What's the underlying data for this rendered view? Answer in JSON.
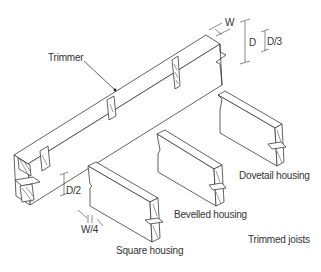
{
  "diagram": {
    "title": "Trimmed joists",
    "labels": {
      "trimmer": "Trimmer",
      "width": "W",
      "depth": "D",
      "depth_third": "D/3",
      "depth_half": "D/2",
      "width_quarter": "W/4",
      "square_housing": "Square housing",
      "bevelled_housing": "Bevelled housing",
      "dovetail_housing": "Dovetail housing",
      "caption": "Trimmed joists"
    },
    "components": [
      {
        "name": "trimmer",
        "type": "beam",
        "note": "long timber with housings cut along its side"
      },
      {
        "name": "square-housing-joist",
        "joint": "Square housing",
        "dimensions": [
          "D/2",
          "W/4"
        ]
      },
      {
        "name": "bevelled-housing-joist",
        "joint": "Bevelled housing"
      },
      {
        "name": "dovetail-housing-joist",
        "joint": "Dovetail housing"
      }
    ],
    "dimensions": [
      {
        "label": "W",
        "meaning": "width of trimmer"
      },
      {
        "label": "D",
        "meaning": "depth of trimmer"
      },
      {
        "label": "D/3",
        "meaning": "depth of tusk / housing offset"
      },
      {
        "label": "D/2",
        "meaning": "housing depth"
      },
      {
        "label": "W/4",
        "meaning": "housing cut into trimmer width"
      }
    ],
    "colors": {
      "line": "#3a3a3a",
      "text": "#333333",
      "background": "#ffffff"
    }
  }
}
